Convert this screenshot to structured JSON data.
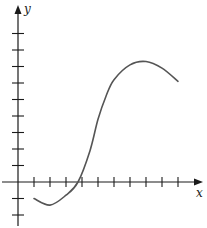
{
  "figure": {
    "x_axis_label": "x",
    "y_axis_label": "y",
    "colors": {
      "axis": "#1a1a1a",
      "curve": "#555555"
    }
  },
  "chart_data": {
    "type": "line",
    "title": "",
    "xlabel": "x",
    "ylabel": "y",
    "x_ticks": [
      1,
      2,
      3,
      4,
      5,
      6,
      7,
      8,
      9,
      10
    ],
    "y_ticks": [
      -2,
      -1,
      1,
      2,
      3,
      4,
      5,
      6,
      7,
      8,
      9
    ],
    "tick_labels_shown": false,
    "grid": false,
    "xlim": [
      -1,
      11
    ],
    "ylim": [
      -2.5,
      10
    ],
    "series": [
      {
        "name": "f(x)",
        "x": [
          1,
          2,
          3,
          3.75,
          4.5,
          5,
          5.5,
          6,
          7,
          8,
          9,
          10
        ],
        "y": [
          -1,
          -1.4,
          -0.8,
          0,
          1.9,
          3.8,
          5.2,
          6.2,
          7.1,
          7.3,
          6.9,
          6.1
        ]
      }
    ],
    "annotations": []
  }
}
